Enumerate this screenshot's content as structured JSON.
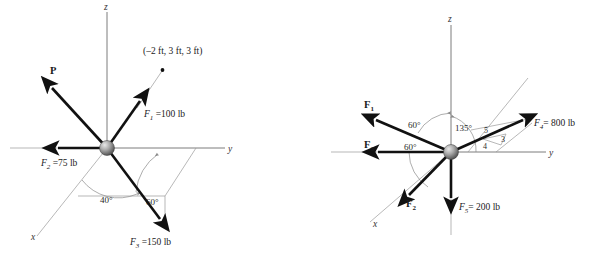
{
  "figures": [
    {
      "id": "left",
      "name": "force-diagram-left",
      "axes": {
        "x": "x",
        "y": "y",
        "z": "z"
      },
      "point_label": "(–2 ft, 3 ft, 3 ft)",
      "vectors": [
        {
          "name": "P",
          "label": "P",
          "bold": true
        },
        {
          "name": "F1",
          "label_main": "F",
          "label_sub": "1",
          "label_tail": " =100 lb"
        },
        {
          "name": "F2",
          "label_main": "F",
          "label_sub": "2",
          "label_tail": " =75 lb"
        },
        {
          "name": "F3",
          "label_main": "F",
          "label_sub": "3",
          "label_tail": " =150 lb"
        }
      ],
      "angles": [
        "40°",
        "60°"
      ]
    },
    {
      "id": "right",
      "name": "force-diagram-right",
      "axes": {
        "x": "x",
        "y": "y",
        "z": "z"
      },
      "vectors": [
        {
          "name": "F1",
          "label_main": "F",
          "label_sub": "1",
          "bold": true
        },
        {
          "name": "F2",
          "label_main": "F",
          "label_sub": "2",
          "bold": true
        },
        {
          "name": "F3",
          "label_main": "F",
          "label_sub": "3",
          "bold": true
        },
        {
          "name": "F4",
          "label_main": "F",
          "label_sub": "4",
          "label_tail": "= 800 lb"
        },
        {
          "name": "F5",
          "label_main": "F",
          "label_sub": "5",
          "label_tail": "= 200 lb"
        }
      ],
      "angles": [
        "60°",
        "135°",
        "60°"
      ],
      "triangle": {
        "hyp": "5",
        "adj": "4",
        "opp": "3"
      }
    }
  ],
  "colors": {
    "vector": "#111111",
    "axis": "#6e6e6e",
    "thin": "#9a9a9a",
    "sphere_light": "#d8d8d8",
    "sphere_dark": "#555555",
    "background": "#ffffff"
  }
}
